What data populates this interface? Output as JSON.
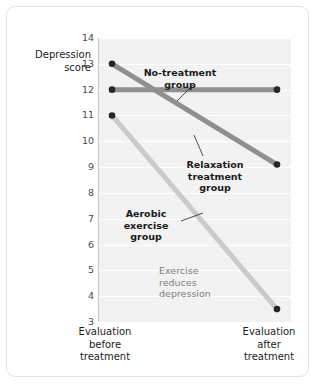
{
  "chart_data": {
    "type": "line",
    "title": "",
    "xlabel": "",
    "ylabel": "Depression score",
    "categories": [
      "Evaluation before treatment",
      "Evaluation after treatment"
    ],
    "ylim": [
      3,
      14
    ],
    "yticks": [
      14,
      13,
      12,
      11,
      10,
      9,
      8,
      7,
      6,
      5,
      4,
      3
    ],
    "grid": true,
    "legend_position": "inline-labels",
    "series": [
      {
        "name": "No-treatment group",
        "values": [
          12,
          12
        ],
        "color": "#8f8f8f",
        "marker": "circle",
        "marker_color": "#262626"
      },
      {
        "name": "Relaxation treatment group",
        "values": [
          13,
          9.1
        ],
        "color": "#8f8f8f",
        "marker": "circle",
        "marker_color": "#262626"
      },
      {
        "name": "Aerobic exercise group",
        "values": [
          11,
          3.5
        ],
        "color": "#cacaca",
        "marker": "circle",
        "marker_color": "#262626"
      }
    ],
    "annotations": [
      {
        "text": "Exercise reduces depression"
      }
    ]
  },
  "axis": {
    "y_label_line1": "Depression",
    "y_label_line2": "score",
    "y_ticks": [
      "14",
      "13",
      "12",
      "11",
      "10",
      "9",
      "8",
      "7",
      "6",
      "5",
      "4",
      "3"
    ],
    "x_tick_0_line1": "Evaluation",
    "x_tick_0_line2": "before",
    "x_tick_0_line3": "treatment",
    "x_tick_1_line1": "Evaluation",
    "x_tick_1_line2": "after",
    "x_tick_1_line3": "treatment"
  },
  "labels": {
    "no_treatment_line1": "No-treatment",
    "no_treatment_line2": "group",
    "relaxation_line1": "Relaxation",
    "relaxation_line2": "treatment",
    "relaxation_line3": "group",
    "aerobic_line1": "Aerobic",
    "aerobic_line2": "exercise",
    "aerobic_line3": "group",
    "note_line1": "Exercise",
    "note_line2": "reduces",
    "note_line3": "depression"
  },
  "colors": {
    "plot_background": "#f2f2f2",
    "gridline": "#ffffff",
    "axis_line": "#c9c9c9",
    "card_border": "#e2e2e2",
    "series_dark": "#8f8f8f",
    "series_light": "#cacaca",
    "marker": "#262626",
    "leader_line": "#3a3a3a"
  }
}
